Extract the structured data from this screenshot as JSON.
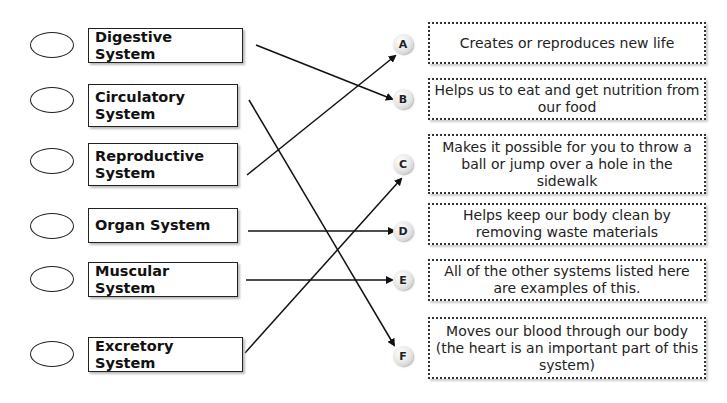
{
  "systems": [
    {
      "label": "Digestive System",
      "top": 28,
      "height": 35
    },
    {
      "label": "Circulatory System",
      "top": 84,
      "height": 43
    },
    {
      "label": "Reproductive System",
      "top": 143,
      "height": 43
    },
    {
      "label": "Organ System",
      "top": 208,
      "height": 35
    },
    {
      "label": "Muscular System",
      "top": 262,
      "height": 35
    },
    {
      "label": "Excretory System",
      "top": 337,
      "height": 35
    }
  ],
  "descriptions": [
    {
      "letter": "A",
      "text": "Creates or reproduces new life",
      "top": 22,
      "height": 42
    },
    {
      "letter": "B",
      "text": "Helps us to eat and get nutrition from our food",
      "top": 78,
      "height": 42
    },
    {
      "letter": "C",
      "text": "Makes it possible for you to throw a ball or jump over a hole in the sidewalk",
      "top": 134,
      "height": 60
    },
    {
      "letter": "D",
      "text": "Helps keep our body clean by removing waste materials",
      "top": 203,
      "height": 42
    },
    {
      "letter": "E",
      "text": "All of the other systems listed here are examples of this.",
      "top": 259,
      "height": 42
    },
    {
      "letter": "F",
      "text": "Moves our blood through our body (the heart is an important part of this system)",
      "top": 317,
      "height": 62
    }
  ],
  "connections": [
    {
      "from": "Digestive System",
      "to": "B"
    },
    {
      "from": "Circulatory System",
      "to": "F"
    },
    {
      "from": "Reproductive System",
      "to": "A"
    },
    {
      "from": "Organ System",
      "to": "D"
    },
    {
      "from": "Muscular System",
      "to": "E"
    },
    {
      "from": "Excretory System",
      "to": "C"
    }
  ],
  "colors": {
    "line": "#111111",
    "border": "#222222"
  }
}
